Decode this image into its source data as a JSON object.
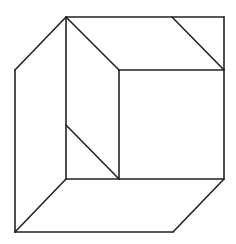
{
  "diagram": {
    "title": "",
    "background": "#ffffff",
    "stroke_color": "#222222",
    "stroke_width": 1.6,
    "lines": [
      {
        "id": "outer-top",
        "x1": 66,
        "y1": 17,
        "x2": 224,
        "y2": 17
      },
      {
        "id": "outer-right-upper",
        "x1": 224,
        "y1": 17,
        "x2": 224,
        "y2": 179
      },
      {
        "id": "top-left-slant",
        "x1": 66,
        "y1": 17,
        "x2": 15,
        "y2": 70
      },
      {
        "id": "left-edge",
        "x1": 15,
        "y1": 70,
        "x2": 15,
        "y2": 232
      },
      {
        "id": "bottom-edge",
        "x1": 15,
        "y1": 232,
        "x2": 173,
        "y2": 232
      },
      {
        "id": "bottom-right-slant",
        "x1": 224,
        "y1": 179,
        "x2": 173,
        "y2": 232
      },
      {
        "id": "inner-vertical-left",
        "x1": 66,
        "y1": 17,
        "x2": 66,
        "y2": 179
      },
      {
        "id": "inner-top-diagonal",
        "x1": 66,
        "y1": 17,
        "x2": 119,
        "y2": 70
      },
      {
        "id": "inner-horizontal-top",
        "x1": 119,
        "y1": 70,
        "x2": 224,
        "y2": 70
      },
      {
        "id": "top-right-diagonal",
        "x1": 172,
        "y1": 17,
        "x2": 224,
        "y2": 70
      },
      {
        "id": "inner-vertical-mid",
        "x1": 119,
        "y1": 70,
        "x2": 119,
        "y2": 179
      },
      {
        "id": "inner-horizontal-bottom",
        "x1": 66,
        "y1": 179,
        "x2": 224,
        "y2": 179
      },
      {
        "id": "lower-diagonal",
        "x1": 66,
        "y1": 125,
        "x2": 119,
        "y2": 179
      },
      {
        "id": "bottom-left-slant",
        "x1": 66,
        "y1": 179,
        "x2": 15,
        "y2": 232
      }
    ]
  }
}
